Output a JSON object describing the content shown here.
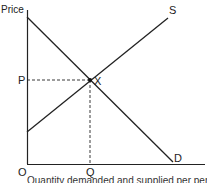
{
  "diagram": {
    "type": "supply-demand",
    "y_axis_label": "Price",
    "origin_label": "O",
    "curves": [
      {
        "name": "S",
        "label": "S",
        "from": [
          27,
          132
        ],
        "to": [
          168,
          18
        ]
      },
      {
        "name": "D",
        "label": "D",
        "from": [
          27,
          17
        ],
        "to": [
          173,
          162
        ]
      }
    ],
    "equilibrium": {
      "label": "X",
      "price_label": "P",
      "quantity_label": "Q",
      "point": [
        90,
        80
      ]
    },
    "caption": "Quantity demanded and supplied per period"
  },
  "colors": {
    "line": "#222222",
    "background": "#ffffff"
  }
}
